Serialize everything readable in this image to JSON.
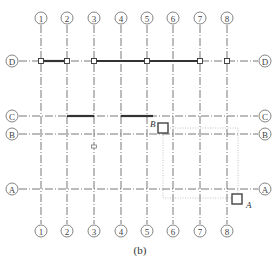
{
  "diagram": {
    "caption": "(b)",
    "columns": [
      {
        "label": "1",
        "x": 41
      },
      {
        "label": "2",
        "x": 67
      },
      {
        "label": "3",
        "x": 94
      },
      {
        "label": "4",
        "x": 121
      },
      {
        "label": "5",
        "x": 147
      },
      {
        "label": "6",
        "x": 173
      },
      {
        "label": "7",
        "x": 200
      },
      {
        "label": "8",
        "x": 227
      }
    ],
    "rows": [
      {
        "label": "D",
        "y": 61
      },
      {
        "label": "C",
        "y": 116
      },
      {
        "label": "B",
        "y": 134
      },
      {
        "label": "A",
        "y": 189
      }
    ],
    "markers": [
      {
        "label": "B",
        "x": 163,
        "y": 128
      },
      {
        "label": "A",
        "x": 237,
        "y": 199
      }
    ],
    "colors": {
      "line": "#555555",
      "beam": "#333333",
      "dotted": "#aaaaaa"
    }
  }
}
